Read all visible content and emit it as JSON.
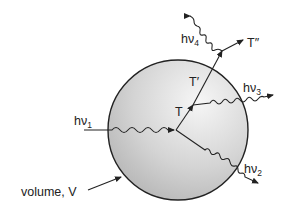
{
  "diagram": {
    "sphere_label": "volume, V",
    "photons": [
      {
        "id": "hv1",
        "base": "hν",
        "sub": "1",
        "role": "incoming"
      },
      {
        "id": "hv2",
        "base": "hν",
        "sub": "2",
        "role": "outgoing"
      },
      {
        "id": "hv3",
        "base": "hν",
        "sub": "3",
        "role": "outgoing"
      },
      {
        "id": "hv4",
        "base": "hν",
        "sub": "4",
        "role": "outgoing"
      }
    ],
    "states": [
      {
        "id": "T",
        "label": "T"
      },
      {
        "id": "T1",
        "label": "T′"
      },
      {
        "id": "T2",
        "label": "T″"
      }
    ],
    "colors": {
      "stroke": "#222222",
      "sphere_light": "#f4f4f4",
      "sphere_dark": "#b8b8b8"
    }
  }
}
